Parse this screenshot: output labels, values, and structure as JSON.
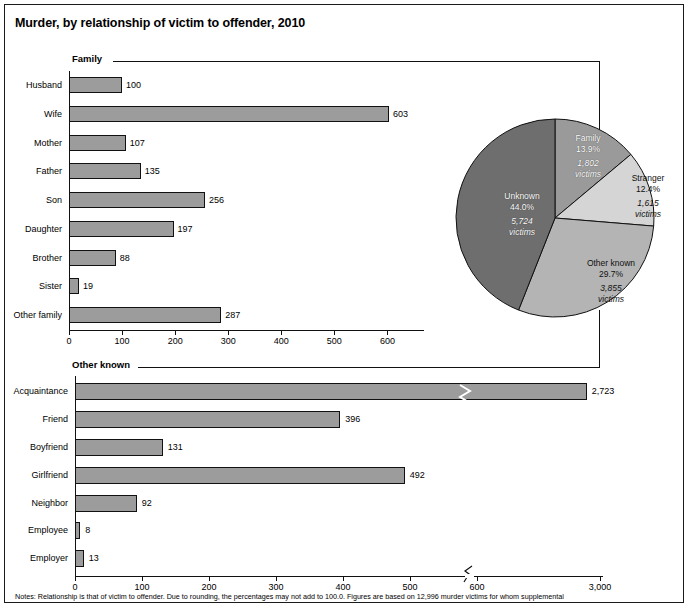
{
  "title": "Murder, by relationship of victim to offender, 2010",
  "notes": "Notes: Relationship is that of victim to offender. Due to rounding, the percentages may not add to 100.0. Figures are based on 12,996 murder victims for whom supplemental",
  "sections": {
    "family_label": "Family",
    "other_known_label": "Other known"
  },
  "colors": {
    "bar_fill": "#9c9c9c",
    "bar_stroke": "#111111",
    "pie_unknown": "#6e6e6e",
    "pie_family": "#9a9a9a",
    "pie_stranger": "#d5d5d5",
    "pie_other_known": "#b4b4b4"
  },
  "chart_data": [
    {
      "type": "bar",
      "title": "Family",
      "orientation": "horizontal",
      "categories": [
        "Husband",
        "Wife",
        "Mother",
        "Father",
        "Son",
        "Daughter",
        "Brother",
        "Sister",
        "Other family"
      ],
      "values": [
        100,
        603,
        107,
        135,
        256,
        197,
        88,
        19,
        287
      ],
      "value_labels": [
        "100",
        "603",
        "107",
        "135",
        "256",
        "197",
        "88",
        "19",
        "287"
      ],
      "xlabel": "",
      "ylabel": "",
      "xlim": [
        0,
        650
      ],
      "ticks": [
        0,
        100,
        200,
        300,
        400,
        500,
        600
      ],
      "tick_labels": [
        "0",
        "100",
        "200",
        "300",
        "400",
        "500",
        "600"
      ],
      "grid": false
    },
    {
      "type": "bar",
      "title": "Other known",
      "orientation": "horizontal",
      "categories": [
        "Acquaintance",
        "Friend",
        "Boyfriend",
        "Girlfriend",
        "Neighbor",
        "Employee",
        "Employer"
      ],
      "values": [
        2723,
        396,
        131,
        492,
        92,
        8,
        13
      ],
      "value_labels": [
        "2,723",
        "396",
        "131",
        "492",
        "92",
        "8",
        "13"
      ],
      "xlabel": "",
      "ylabel": "",
      "ticks": [
        0,
        100,
        200,
        300,
        400,
        500,
        600,
        3000
      ],
      "tick_labels": [
        "0",
        "100",
        "200",
        "300",
        "400",
        "500",
        "600",
        "3,000"
      ],
      "axis_break_after": "600",
      "grid": false
    },
    {
      "type": "pie",
      "title": "",
      "slices": [
        {
          "name": "Family",
          "percent": 13.9,
          "percent_label": "13.9%",
          "victims": 1802,
          "victims_label": "1,802",
          "victims_unit": "victims"
        },
        {
          "name": "Stranger",
          "percent": 12.4,
          "percent_label": "12.4%",
          "victims": 1615,
          "victims_label": "1,615",
          "victims_unit": "victims"
        },
        {
          "name": "Other known",
          "percent": 29.7,
          "percent_label": "29.7%",
          "victims": 3855,
          "victims_label": "3,855",
          "victims_unit": "victims"
        },
        {
          "name": "Unknown",
          "percent": 44.0,
          "percent_label": "44.0%",
          "victims": 5724,
          "victims_label": "5,724",
          "victims_unit": "victims"
        }
      ],
      "total_victims": 12996,
      "legend": "inside-slices"
    }
  ]
}
